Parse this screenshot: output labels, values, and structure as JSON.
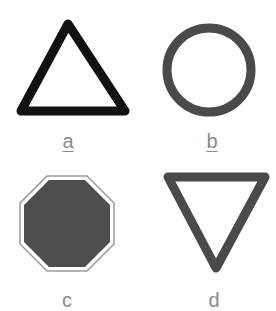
{
  "shapes": [
    {
      "id": "a",
      "label": "a",
      "shape": "triangle-up",
      "style": "outline",
      "stroke_color": "#111111",
      "underlined": true
    },
    {
      "id": "b",
      "label": "b",
      "shape": "circle",
      "style": "outline",
      "stroke_color": "#4a4a4a",
      "underlined": true
    },
    {
      "id": "c",
      "label": "c",
      "shape": "octagon",
      "style": "filled",
      "fill_color": "#4e4e4e",
      "border_color": "#9a9a9a",
      "underlined": false
    },
    {
      "id": "d",
      "label": "d",
      "shape": "triangle-down",
      "style": "outline",
      "stroke_color": "#4a4a4a",
      "underlined": false
    }
  ],
  "colors": {
    "background": "#ffffff",
    "label": "#8a8a8a"
  }
}
